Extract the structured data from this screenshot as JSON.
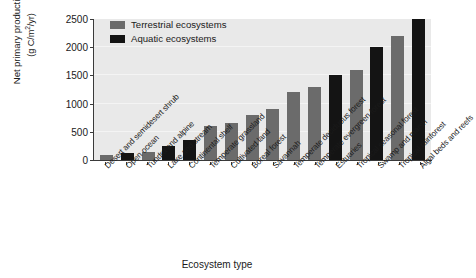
{
  "chart_data": {
    "type": "bar",
    "title": "",
    "xlabel": "Ecosystem type",
    "ylabel": "Net primary productivity (g C/m2/yr)",
    "ylabel_line1": "Net primary productivity",
    "ylabel_line2_prefix": "(g C/m",
    "ylabel_line2_sup": "2",
    "ylabel_line2_suffix": "/yr)",
    "ylim": [
      0,
      2500
    ],
    "yticks": [
      0,
      500,
      1000,
      1500,
      2000,
      2500
    ],
    "ytick_labels": [
      "0",
      "500",
      "1000",
      "1500",
      "2000",
      "2500"
    ],
    "grid": true,
    "legend_position": "top-left-inside",
    "categories": [
      "Desert and semidesert shrub",
      "Open ocean",
      "Tundra and alpine",
      "Lake and stream",
      "Continental shelf",
      "Temperate grassland",
      "Cultivated land",
      "Boreal forest",
      "Savannah",
      "Temperate deciduous forest",
      "Temperate evergreen forest",
      "Estuaries",
      "Tropical seasonal forest",
      "Swamp and marsh",
      "Tropical rainforest",
      "Algal beds and reefs"
    ],
    "values": [
      90,
      125,
      140,
      250,
      360,
      600,
      650,
      800,
      900,
      1200,
      1300,
      1500,
      1600,
      2000,
      2200,
      2500
    ],
    "groups": [
      "terrestrial",
      "aquatic",
      "terrestrial",
      "aquatic",
      "aquatic",
      "terrestrial",
      "terrestrial",
      "terrestrial",
      "terrestrial",
      "terrestrial",
      "terrestrial",
      "aquatic",
      "terrestrial",
      "aquatic",
      "terrestrial",
      "aquatic"
    ],
    "series": [
      {
        "name": "Terrestrial ecosystems",
        "color": "#6b6b6b",
        "points": [
          {
            "category": "Desert and semidesert shrub",
            "value": 90
          },
          {
            "category": "Tundra and alpine",
            "value": 140
          },
          {
            "category": "Temperate grassland",
            "value": 600
          },
          {
            "category": "Cultivated land",
            "value": 650
          },
          {
            "category": "Boreal forest",
            "value": 800
          },
          {
            "category": "Savannah",
            "value": 900
          },
          {
            "category": "Temperate deciduous forest",
            "value": 1200
          },
          {
            "category": "Temperate evergreen forest",
            "value": 1300
          },
          {
            "category": "Tropical seasonal forest",
            "value": 1600
          },
          {
            "category": "Tropical rainforest",
            "value": 2200
          }
        ]
      },
      {
        "name": "Aquatic ecosystems",
        "color": "#141414",
        "points": [
          {
            "category": "Open ocean",
            "value": 125
          },
          {
            "category": "Lake and stream",
            "value": 250
          },
          {
            "category": "Continental shelf",
            "value": 360
          },
          {
            "category": "Estuaries",
            "value": 1500
          },
          {
            "category": "Swamp and marsh",
            "value": 2000
          },
          {
            "category": "Algal beds and reefs",
            "value": 2500
          }
        ]
      }
    ],
    "colors": {
      "terrestrial": "#6b6b6b",
      "aquatic": "#141414",
      "plot_background": "#e9e9e9",
      "gridline": "#f4f4f4",
      "axis": "#3a3a3a",
      "text": "#1a1a1a",
      "figure_background": "#ffffff"
    }
  },
  "legend": {
    "items": [
      {
        "label": "Terrestrial ecosystems",
        "color": "#6b6b6b",
        "swatch_name": "legend-swatch-terrestrial"
      },
      {
        "label": "Aquatic ecosystems",
        "color": "#141414",
        "swatch_name": "legend-swatch-aquatic"
      }
    ]
  }
}
